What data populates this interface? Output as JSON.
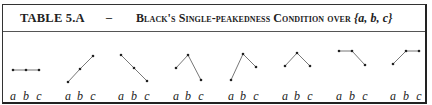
{
  "table": {
    "label": "TABLE 5.A",
    "separator": "–",
    "title_prefix": "Black's Single-peakedness Condition over ",
    "title_set": "{a, b, c}"
  },
  "axis_labels": [
    "a",
    "b",
    "c"
  ],
  "graphs": [
    {
      "name": "flat",
      "points": [
        [
          13,
          70
        ],
        [
          26,
          70
        ],
        [
          39,
          70
        ]
      ]
    },
    {
      "name": "increasing",
      "points": [
        [
          68,
          82
        ],
        [
          80,
          69
        ],
        [
          93,
          56
        ]
      ]
    },
    {
      "name": "decreasing",
      "points": [
        [
          121,
          55
        ],
        [
          134,
          68
        ],
        [
          147,
          81
        ]
      ]
    },
    {
      "name": "peak-b-a-higher-than-c",
      "points": [
        [
          176,
          68
        ],
        [
          188,
          55
        ],
        [
          201,
          80
        ]
      ]
    },
    {
      "name": "peak-b-c-higher-than-a",
      "points": [
        [
          231,
          80
        ],
        [
          243,
          54
        ],
        [
          256,
          67
        ]
      ]
    },
    {
      "name": "peak-b-symmetric",
      "points": [
        [
          285,
          66
        ],
        [
          297,
          53
        ],
        [
          310,
          66
        ]
      ]
    },
    {
      "name": "plateau-ab-then-down",
      "points": [
        [
          339,
          51
        ],
        [
          352,
          51
        ],
        [
          365,
          65
        ]
      ]
    },
    {
      "name": "up-then-plateau-bc",
      "points": [
        [
          393,
          64
        ],
        [
          406,
          51
        ],
        [
          419,
          51
        ]
      ]
    }
  ],
  "colors": {
    "line": "#777777",
    "point": "#222222",
    "border": "#333333"
  }
}
